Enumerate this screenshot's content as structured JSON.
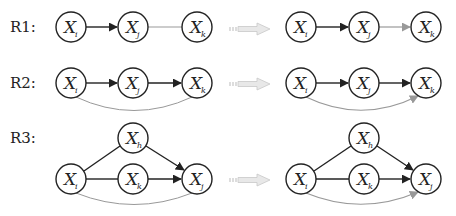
{
  "rules": [
    {
      "label": "R1:"
    },
    {
      "label": "R2:"
    },
    {
      "label": "R3:"
    }
  ],
  "node_variable": "X",
  "nodes": {
    "r1_left": [
      {
        "id": "i",
        "sub": "i",
        "x": 71,
        "y": 27
      },
      {
        "id": "j",
        "sub": "j",
        "x": 133,
        "y": 27
      },
      {
        "id": "k",
        "sub": "k",
        "x": 197,
        "y": 27
      }
    ],
    "r1_right": [
      {
        "id": "i",
        "sub": "i",
        "x": 301,
        "y": 27
      },
      {
        "id": "j",
        "sub": "j",
        "x": 364,
        "y": 27
      },
      {
        "id": "k",
        "sub": "k",
        "x": 426,
        "y": 27
      }
    ],
    "r2_left": [
      {
        "id": "i",
        "sub": "i",
        "x": 71,
        "y": 83
      },
      {
        "id": "j",
        "sub": "j",
        "x": 133,
        "y": 83
      },
      {
        "id": "k",
        "sub": "k",
        "x": 197,
        "y": 83
      }
    ],
    "r2_right": [
      {
        "id": "i",
        "sub": "i",
        "x": 301,
        "y": 83
      },
      {
        "id": "j",
        "sub": "j",
        "x": 364,
        "y": 83
      },
      {
        "id": "k",
        "sub": "k",
        "x": 426,
        "y": 83
      }
    ],
    "r3_left": [
      {
        "id": "h",
        "sub": "h",
        "x": 133,
        "y": 138
      },
      {
        "id": "i",
        "sub": "i",
        "x": 71,
        "y": 179
      },
      {
        "id": "k",
        "sub": "k",
        "x": 133,
        "y": 179
      },
      {
        "id": "j",
        "sub": "j",
        "x": 197,
        "y": 179
      }
    ],
    "r3_right": [
      {
        "id": "h",
        "sub": "h",
        "x": 364,
        "y": 138
      },
      {
        "id": "i",
        "sub": "i",
        "x": 301,
        "y": 179
      },
      {
        "id": "k",
        "sub": "k",
        "x": 364,
        "y": 179
      },
      {
        "id": "j",
        "sub": "j",
        "x": 426,
        "y": 179
      }
    ]
  },
  "colors": {
    "edge": "#222222",
    "inferred_edge": "#999999",
    "transform_arrow": "#dddddd"
  }
}
